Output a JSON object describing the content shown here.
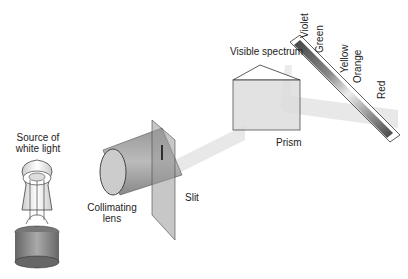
{
  "labels": {
    "source": "Source of white light",
    "source_line1": "Source of",
    "source_line2": "white light",
    "lens_line1": "Collimating",
    "lens_line2": "lens",
    "slit": "Slit",
    "prism": "Prism",
    "visible_spectrum": "Visible spectrum"
  },
  "spectrum_colors": [
    "Violet",
    "Green",
    "Yellow",
    "Orange",
    "Red"
  ],
  "colors": {
    "beam": "#e6e6e6",
    "component_gray": "#9a9a9a",
    "outline": "#333333"
  }
}
